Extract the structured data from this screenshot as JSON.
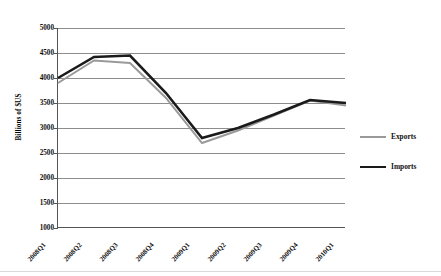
{
  "chart_data": {
    "type": "line",
    "title": "",
    "xlabel": "",
    "ylabel": "Billions of $US",
    "ylim": [
      1000,
      5000
    ],
    "ytick_step": 500,
    "yticks": [
      "5000",
      "4500",
      "4000",
      "3500",
      "3000",
      "2500",
      "2000",
      "1500",
      "1000"
    ],
    "grid": true,
    "legend_position": "right",
    "categories": [
      "2008Q1",
      "2008Q2",
      "2008Q3",
      "2008Q4",
      "2009Q1",
      "2009Q2",
      "2009Q3",
      "2009Q4",
      "2010Q1"
    ],
    "series": [
      {
        "name": "Exports",
        "color": "#9a9a9a",
        "width": 2.0,
        "values": [
          3900,
          4350,
          4300,
          3600,
          2700,
          2950,
          3250,
          3550,
          3450
        ]
      },
      {
        "name": "Imports",
        "color": "#1a1a1a",
        "width": 2.6,
        "values": [
          4000,
          4420,
          4450,
          3700,
          2800,
          3000,
          3270,
          3560,
          3500
        ]
      }
    ]
  },
  "axis": {
    "y_title": "Billions of $US"
  },
  "legend": {
    "items": [
      {
        "label": "Exports",
        "color": "#9a9a9a",
        "thickness": "2.0"
      },
      {
        "label": "Imports",
        "color": "#1a1a1a",
        "thickness": "2.8"
      }
    ]
  }
}
